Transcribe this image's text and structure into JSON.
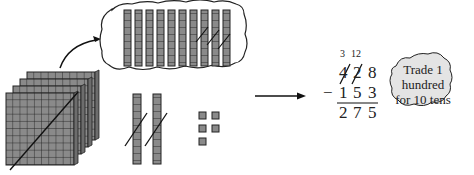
{
  "figure": {
    "blocks": {
      "hundreds_flats": 4,
      "hundreds_crossed": 1,
      "tens_in_bubble": 10,
      "tens_in_bubble_crossed": 3,
      "tens_rods_below": 2,
      "tens_rods_below_crossed": 2,
      "ones_units": 5
    },
    "subtraction": {
      "regroup_hundreds": "3",
      "regroup_tens": "12",
      "minuend_digits": [
        "4",
        "2",
        "8"
      ],
      "operator": "−",
      "subtrahend_digits": [
        "1",
        "5",
        "3"
      ],
      "result_digits": [
        "2",
        "7",
        "5"
      ]
    },
    "callout": {
      "line1": "Trade 1",
      "line2": "hundred",
      "line3": "for 10 tens"
    },
    "colors": {
      "block_fill": "#8a8a8a",
      "block_line": "#222222",
      "ink": "#222222"
    }
  }
}
